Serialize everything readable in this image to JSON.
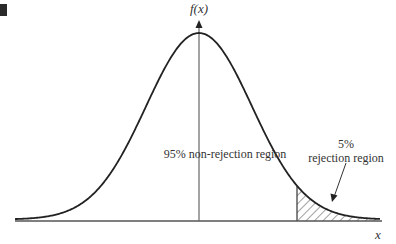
{
  "figure": {
    "y_axis_label": "f(x)",
    "x_axis_label": "x",
    "center_label": "95% non-rejection region",
    "tail_label_line1": "5%",
    "tail_label_line2": "rejection region"
  },
  "colors": {
    "curve": "#222222",
    "axis": "#555555",
    "hatch": "#444444",
    "text": "#333333"
  },
  "chart_data": {
    "type": "area",
    "title": "",
    "xlabel": "x",
    "ylabel": "f(x)",
    "distribution": "normal",
    "regions": [
      {
        "name": "non-rejection region",
        "percent": 95,
        "side": "left/center"
      },
      {
        "name": "rejection region",
        "percent": 5,
        "side": "right tail",
        "hatched": true
      }
    ],
    "annotations": [
      "95% non-rejection region",
      "5% rejection region"
    ],
    "grid": false
  }
}
